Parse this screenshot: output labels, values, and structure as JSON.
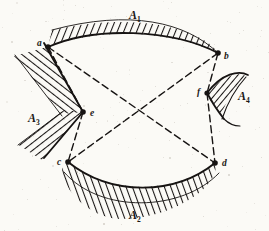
{
  "figure": {
    "kind": "geometry-diagram",
    "background_color": "#fbfaf6",
    "ink_color": "#161312"
  },
  "regions": [
    {
      "id": "A1",
      "label": "A",
      "subscript": "1",
      "label_x": 129,
      "label_y": 9,
      "boundary": "upper-arc",
      "hatch_side": "above"
    },
    {
      "id": "A2",
      "label": "A",
      "subscript": "2",
      "label_x": 129,
      "label_y": 209,
      "boundary": "lower-arc",
      "hatch_side": "below"
    },
    {
      "id": "A3",
      "label": "A",
      "subscript": "3",
      "label_x": 28,
      "label_y": 112,
      "boundary": "left-wedge",
      "hatch_side": "left"
    },
    {
      "id": "A4",
      "label": "A",
      "subscript": "4",
      "label_x": 238,
      "label_y": 90,
      "boundary": "right-lens",
      "hatch_side": "inside"
    }
  ],
  "vertices": [
    {
      "id": "a",
      "label": "a",
      "x": 48,
      "y": 47,
      "label_x": 37,
      "label_y": 39
    },
    {
      "id": "b",
      "label": "b",
      "x": 218,
      "y": 53,
      "label_x": 224,
      "label_y": 52
    },
    {
      "id": "c",
      "label": "c",
      "x": 68,
      "y": 162,
      "label_x": 57,
      "label_y": 158
    },
    {
      "id": "d",
      "label": "d",
      "x": 215,
      "y": 163,
      "label_x": 222,
      "label_y": 159
    },
    {
      "id": "e",
      "label": "e",
      "x": 83,
      "y": 112,
      "label_x": 90,
      "label_y": 109
    },
    {
      "id": "f",
      "label": "f",
      "x": 207,
      "y": 93,
      "label_x": 197,
      "label_y": 88
    }
  ],
  "dashed_chords": [
    {
      "from": "a",
      "to": "e"
    },
    {
      "from": "a",
      "to": "d"
    },
    {
      "from": "b",
      "to": "c"
    },
    {
      "from": "b",
      "to": "f"
    },
    {
      "from": "e",
      "to": "c"
    },
    {
      "from": "f",
      "to": "d"
    }
  ],
  "style": {
    "solid_stroke_width": 1.6,
    "dash_pattern": "7 4",
    "dash_stroke_width": 1.4,
    "hatch_stroke_width": 1.5,
    "vertex_dot_radius": 2.6
  }
}
